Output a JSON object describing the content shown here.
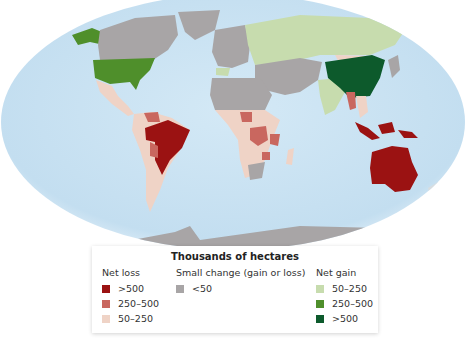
{
  "legend": {
    "title": "Thousands of hectares",
    "groups": [
      {
        "heading": "Net loss",
        "items": [
          {
            "label": ">500",
            "color": "#9b1212"
          },
          {
            "label": "250–500",
            "color": "#c9675f"
          },
          {
            "label": "50–250",
            "color": "#efd3c6"
          }
        ]
      },
      {
        "heading": "Small change (gain or loss)",
        "items": [
          {
            "label": "<50",
            "color": "#a8a5a6"
          }
        ]
      },
      {
        "heading": "Net gain",
        "items": [
          {
            "label": "50–250",
            "color": "#c7dcae"
          },
          {
            "label": "250–500",
            "color": "#4f8f2b"
          },
          {
            "label": ">500",
            "color": "#0d5a2c"
          }
        ]
      }
    ]
  },
  "map": {
    "ocean_color": "#c9e2f2",
    "regions": [
      {
        "name": "Alaska",
        "category": "Net gain 250–500"
      },
      {
        "name": "Canada",
        "category": "Small change <50"
      },
      {
        "name": "Greenland",
        "category": "Small change <50"
      },
      {
        "name": "United States",
        "category": "Net gain 250–500"
      },
      {
        "name": "Mexico / Central America",
        "category": "Net loss 50–250"
      },
      {
        "name": "Brazil",
        "category": "Net loss >500"
      },
      {
        "name": "Venezuela",
        "category": "Net loss 250–500"
      },
      {
        "name": "Bolivia",
        "category": "Net loss 250–500"
      },
      {
        "name": "Rest of South America",
        "category": "Net loss 50–250"
      },
      {
        "name": "Europe",
        "category": "Small change <50"
      },
      {
        "name": "Russia",
        "category": "Net gain 50–250"
      },
      {
        "name": "India",
        "category": "Net gain 50–250"
      },
      {
        "name": "China",
        "category": "Net gain >500"
      },
      {
        "name": "Mongolia",
        "category": "Net loss 50–250"
      },
      {
        "name": "Myanmar",
        "category": "Net loss 250–500"
      },
      {
        "name": "Indonesia",
        "category": "Net loss >500"
      },
      {
        "name": "Australia",
        "category": "Net loss >500"
      },
      {
        "name": "North Africa / Middle East",
        "category": "Small change <50"
      },
      {
        "name": "Nigeria",
        "category": "Net loss 250–500"
      },
      {
        "name": "DR Congo",
        "category": "Net loss 250–500"
      },
      {
        "name": "Tanzania",
        "category": "Net loss 250–500"
      },
      {
        "name": "Zimbabwe",
        "category": "Net loss 250–500"
      },
      {
        "name": "Sub-Saharan Africa (other)",
        "category": "Net loss 50–250"
      },
      {
        "name": "Antarctica",
        "category": "Small change <50"
      }
    ]
  }
}
